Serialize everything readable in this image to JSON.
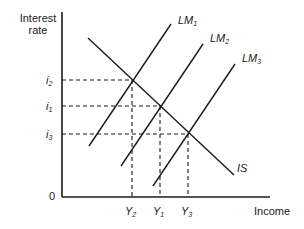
{
  "diagram": {
    "title": "",
    "axes": {
      "y_label_line1": "Interest",
      "y_label_line2": "rate",
      "x_label": "Income",
      "origin": "0"
    },
    "curves": [
      {
        "id": "LM1",
        "base": "LM",
        "sub": "1"
      },
      {
        "id": "LM2",
        "base": "LM",
        "sub": "2"
      },
      {
        "id": "LM3",
        "base": "LM",
        "sub": "3"
      },
      {
        "id": "IS",
        "base": "IS",
        "sub": ""
      }
    ],
    "interest_ticks": [
      {
        "base": "i",
        "sub": "2"
      },
      {
        "base": "i",
        "sub": "1"
      },
      {
        "base": "i",
        "sub": "3"
      }
    ],
    "income_ticks": [
      {
        "base": "Y",
        "sub": "2"
      },
      {
        "base": "Y",
        "sub": "1"
      },
      {
        "base": "Y",
        "sub": "3"
      }
    ],
    "equilibria": [
      {
        "curves": "IS-LM1",
        "interest": "i2",
        "income": "Y2"
      },
      {
        "curves": "IS-LM2",
        "interest": "i1",
        "income": "Y1"
      },
      {
        "curves": "IS-LM3",
        "interest": "i3",
        "income": "Y3"
      }
    ],
    "colors": {
      "line": "#1a1a1a",
      "text": "#222222",
      "background": "#ffffff"
    }
  }
}
